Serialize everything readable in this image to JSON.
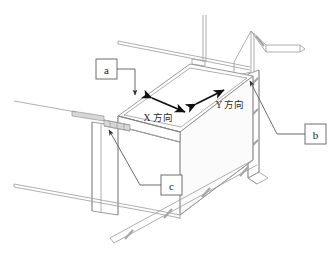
{
  "figure": {
    "title": "",
    "callouts": [
      {
        "id": "a",
        "label": "a",
        "name": "callout-a"
      },
      {
        "id": "b",
        "label": "b",
        "name": "callout-b"
      },
      {
        "id": "c",
        "label": "c",
        "name": "callout-c"
      }
    ],
    "axis_labels": [
      {
        "id": "x",
        "label": "X 方向"
      },
      {
        "id": "y",
        "label": "Y 方向"
      }
    ],
    "colors": {
      "line": "#9a9a9a",
      "line_dark": "#7d7d7d",
      "hatch": "#a6a6a6",
      "bracket": "#d7d7d7",
      "arrow": "#111111",
      "callout_border": "#6e6e6e",
      "background": "#ffffff",
      "text": "#1a1a1a"
    }
  }
}
